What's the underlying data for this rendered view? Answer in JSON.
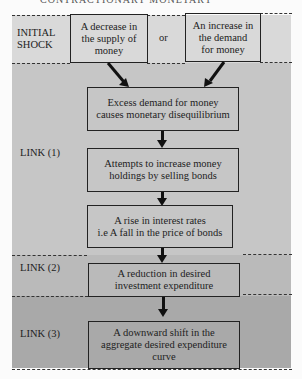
{
  "header": {
    "partial_title": "CONTRACTIONARY MONETARY"
  },
  "rows": {
    "initial_shock": {
      "label_line1": "INITIAL",
      "label_line2": "SHOCK",
      "box_left": {
        "line1": "A decrease in",
        "line2": "the supply of",
        "line3": "money"
      },
      "connector": "or",
      "box_right": {
        "line1": "An increase in",
        "line2": "the demand",
        "line3": "for money"
      }
    },
    "link1": {
      "label": "LINK (1)",
      "boxes": [
        {
          "line1": "Excess demand for money",
          "line2": "causes monetary disequilibrium"
        },
        {
          "line1": "Attempts to increase money",
          "line2": "holdings by selling bonds"
        },
        {
          "line1": "A rise in interest rates",
          "line2": "i.e A fall in the price of bonds"
        }
      ]
    },
    "link2": {
      "label": "LINK (2)",
      "box": {
        "line1": "A reduction in desired",
        "line2": "investment expenditure"
      }
    },
    "link3": {
      "label": "LINK (3)",
      "box": {
        "line1": "A downward shift in the",
        "line2": "aggregate desired expenditure",
        "line3": "curve"
      }
    }
  },
  "colors": {
    "initial_band": "#d9d9d9",
    "link1_band": "#c6c6c6",
    "link2_band": "#bababa",
    "link3_band": "#a9a9a9",
    "line": "#222222"
  }
}
